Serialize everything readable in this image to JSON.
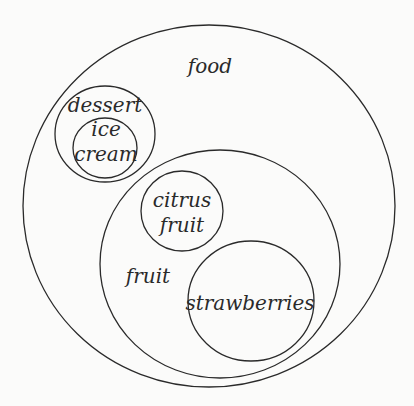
{
  "diagram": {
    "type": "nested-venn",
    "stroke_color": "#2a2a2a",
    "background": "#fbfbfa",
    "sets": [
      {
        "id": "food",
        "label": "food",
        "cx": 209,
        "cy": 206,
        "rx": 186,
        "ry": 181
      },
      {
        "id": "dessert",
        "label": "dessert",
        "cx": 105,
        "cy": 134,
        "rx": 50,
        "ry": 48,
        "parent": "food"
      },
      {
        "id": "ice-cream",
        "label_lines": [
          "ice",
          "cream"
        ],
        "cx": 105,
        "cy": 148,
        "rx": 32,
        "ry": 30,
        "parent": "dessert"
      },
      {
        "id": "fruit",
        "label": "fruit",
        "cx": 220,
        "cy": 264,
        "rx": 120,
        "ry": 114,
        "parent": "food"
      },
      {
        "id": "citrus-fruit",
        "label_lines": [
          "citrus",
          "fruit"
        ],
        "cx": 182,
        "cy": 211,
        "rx": 41,
        "ry": 40,
        "parent": "fruit"
      },
      {
        "id": "strawberries",
        "label": "strawberries",
        "cx": 251,
        "cy": 301,
        "rx": 63,
        "ry": 60,
        "parent": "fruit"
      }
    ]
  },
  "labels": {
    "food": "food",
    "dessert": "dessert",
    "ice": "ice",
    "cream": "cream",
    "citrus": "citrus",
    "citrus_fruit": "fruit",
    "fruit": "fruit",
    "strawberries": "strawberries"
  }
}
